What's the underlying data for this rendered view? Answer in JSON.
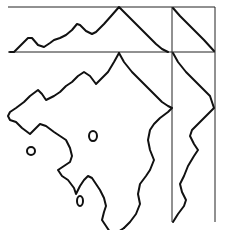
{
  "figure": {
    "background": "#ffffff",
    "stroke_color": "#111111",
    "frame_lines": [
      {
        "name": "top-frame-line",
        "x1": 8,
        "y1": 7,
        "x2": 215,
        "y2": 7
      },
      {
        "name": "divider-horizontal-line",
        "x1": 8,
        "y1": 52,
        "x2": 215,
        "y2": 52
      },
      {
        "name": "divider-vertical-line",
        "x1": 172,
        "y1": 7,
        "x2": 172,
        "y2": 222
      },
      {
        "name": "right-frame-line",
        "x1": 215,
        "y1": 7,
        "x2": 215,
        "y2": 222
      }
    ],
    "top_marginal": "10,52 14,52 22,44 28,38 32,38 38,45 44,47 50,43 54,40 60,38 66,35 72,30 77,24 80,25 86,31 92,34 96,32 104,24 112,15 119,7 126,14 134,22 142,30 150,38 156,44 162,49 168,52",
    "right_top_marginal": "173,8 180,16 188,24 196,32 204,40 214,51",
    "right_marginal": "173,53 178,62 186,72 194,80 202,88 210,96 214,108 206,116 198,124 192,130 190,136 194,144 198,150 194,156 188,166 184,176 180,184 182,192 186,200 184,206 178,214 173,222",
    "contour_outer": "119,53 114,62 108,72 104,76 96,84 90,76 84,72 78,76 72,82 66,86 60,92 54,96 46,100 42,94 38,90 30,96 24,102 16,108 10,112 8,116 10,120 16,122 22,128 30,134 36,128 40,124 46,126 54,132 60,136 66,140 70,148 72,156 70,162 64,166 58,170 62,176 68,180 74,188 76,194 80,186 84,180 88,176 92,178 96,184 100,190 104,198 106,206 104,212 102,220 106,226 110,232",
    "contour_right": "119,53 124,62 132,72 140,80 148,88 156,96 162,102 168,106 172,108 168,112 160,118 154,124 150,130 148,140 150,150 154,160 150,170 146,176 140,184 138,194 140,204 136,214 130,222 124,228",
    "contour_bottom": "110,232 118,232 124,228",
    "dots": [
      {
        "name": "isolated-blob-1",
        "cx": 93,
        "cy": 136,
        "rx": 4,
        "ry": 5
      },
      {
        "name": "isolated-blob-2",
        "cx": 31,
        "cy": 151,
        "rx": 4,
        "ry": 4
      },
      {
        "name": "isolated-blob-3",
        "cx": 80,
        "cy": 201,
        "rx": 3,
        "ry": 5
      }
    ]
  }
}
